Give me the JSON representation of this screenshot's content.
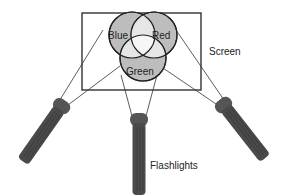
{
  "diagram": {
    "circles": [
      {
        "label": "Blue",
        "fill": "#bdbdbd"
      },
      {
        "label": "Red",
        "fill": "#bdbdbd"
      },
      {
        "label": "Green",
        "fill": "#bdbdbd"
      }
    ],
    "overlap_fill": "#e6e6e6",
    "center_fill": "#f4f4f4",
    "screen_label": "Screen",
    "flashlights_label": "Flashlights",
    "flashlight_color": "#4a4a4a"
  }
}
